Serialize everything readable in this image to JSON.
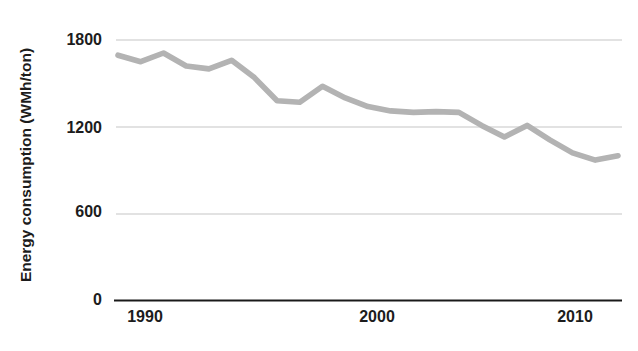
{
  "chart_data": {
    "type": "line",
    "title": "",
    "subtitle": "",
    "xlabel": "",
    "ylabel": "Energy consumption (WMh/ton)",
    "ylim": [
      0,
      1800
    ],
    "xlim": [
      1989,
      2011
    ],
    "yticks": [
      "0",
      "600",
      "1200",
      "1800"
    ],
    "ytick_values": [
      0,
      600,
      1200,
      1800
    ],
    "xticks": [
      "1990",
      "2000",
      "2010"
    ],
    "xtick_values": [
      1990,
      2000,
      2010
    ],
    "grid": "horizontal",
    "legend": "none",
    "series": [
      {
        "name": "Energy consumption",
        "color": "#b3b3b3",
        "x": [
          1989,
          1990,
          1991,
          1992,
          1993,
          1994,
          1995,
          1996,
          1997,
          1998,
          1999,
          2000,
          2001,
          2002,
          2003,
          2004,
          2005,
          2006,
          2007,
          2008,
          2009,
          2010,
          2011
        ],
        "values": [
          1695,
          1650,
          1710,
          1620,
          1600,
          1660,
          1540,
          1380,
          1370,
          1480,
          1400,
          1340,
          1310,
          1300,
          1305,
          1300,
          1210,
          1130,
          1210,
          1110,
          1020,
          970,
          1000
        ]
      }
    ],
    "annotations": []
  },
  "axis": {
    "y_title": "Energy consumption (WMh/ton)",
    "x_labels": [
      "1990",
      "2000",
      "2010"
    ],
    "y_labels": [
      "1800",
      "1200",
      "600",
      "0"
    ]
  },
  "colors": {
    "line": "#b3b3b3",
    "grid": "#d9d9d9",
    "axis": "#1a1a1a",
    "text": "#1c1c1c",
    "background": "#ffffff"
  }
}
